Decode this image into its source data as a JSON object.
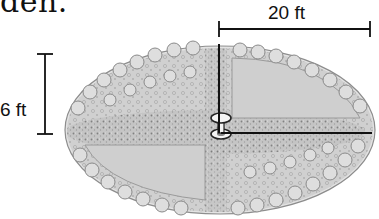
{
  "caption": {
    "text_fragment": "den."
  },
  "figure": {
    "icons": [
      "garden-ellipse",
      "birdbath-icon"
    ],
    "colors": {
      "outline": "#111111",
      "planting_light": "#d9d9d9",
      "planting_mid": "#bdbdbd",
      "planting_dark": "#8a8a8a",
      "background": "#ffffff"
    }
  },
  "dimensions": {
    "horizontal": {
      "label": "20 ft"
    },
    "vertical": {
      "label": "6 ft"
    }
  }
}
